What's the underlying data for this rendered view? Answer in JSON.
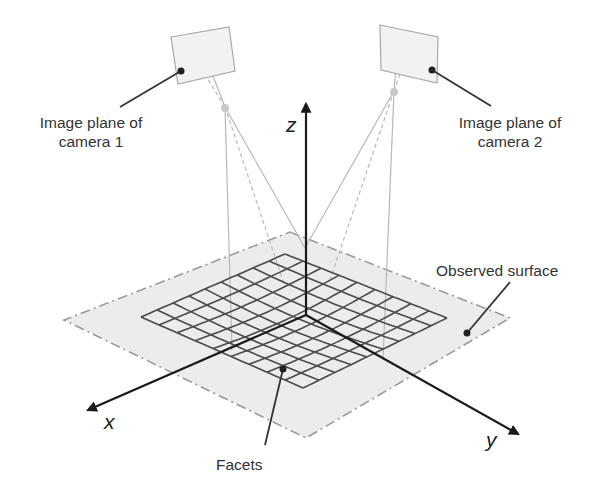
{
  "diagram": {
    "type": "stereo-dic-setup",
    "cameras": [
      {
        "id": "camera1",
        "label_line1": "Image plane of",
        "label_line2": "camera 1"
      },
      {
        "id": "camera2",
        "label_line1": "Image plane of",
        "label_line2": "camera 2"
      }
    ],
    "axes": {
      "x": "x",
      "y": "y",
      "z": "z"
    },
    "annotations": {
      "surface": "Observed surface",
      "facets": "Facets"
    },
    "colors": {
      "axis": "#1a1a1a",
      "grid": "#4a4a4a",
      "surface_fill": "#ececec",
      "surface_outline": "#9a9a9a",
      "camera_plane_fill": "#f2f2f2",
      "camera_plane_stroke": "#a8a8a8",
      "ray": "#b8b8b8",
      "text": "#333333"
    },
    "grid": {
      "rows": 9,
      "cols": 9
    }
  }
}
